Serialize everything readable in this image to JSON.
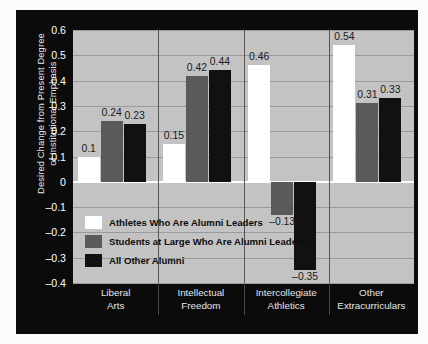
{
  "chart_data": {
    "type": "bar",
    "title": "",
    "xlabel": "",
    "ylabel": "Desired Change from Present Degree\nof Institutional Emphasis",
    "categories": [
      "Liberal\nArts",
      "Intellectual\nFreedom",
      "Intercollegiate\nAthletics",
      "Other\nExtracurriculars"
    ],
    "series": [
      {
        "name": "Athletes Who Are Alumni Leaders",
        "color": "#ffffff",
        "values": [
          0.1,
          0.15,
          0.46,
          0.54
        ],
        "labels": [
          "0.1",
          "0.15",
          "0.46",
          "0.54"
        ]
      },
      {
        "name": "Students at Large Who Are Alumni Leaders",
        "color": "#5a5a5a",
        "values": [
          0.24,
          0.42,
          -0.13,
          0.31
        ],
        "labels": [
          "0.24",
          "0.42",
          "–0.13",
          "0.31"
        ]
      },
      {
        "name": "All Other Alumni",
        "color": "#111111",
        "values": [
          0.23,
          0.44,
          -0.35,
          0.33
        ],
        "labels": [
          "0.23",
          "0.44",
          "–0.35",
          "0.33"
        ]
      }
    ],
    "ylim": [
      -0.4,
      0.6
    ],
    "ytick_values": [
      0.6,
      0.5,
      0.4,
      0.3,
      0.2,
      0.1,
      0,
      -0.1,
      -0.2,
      -0.3,
      -0.4
    ],
    "ytick_labels": [
      "0.6",
      "0.5",
      "0.4",
      "0.3",
      "0.2",
      "0.1",
      "0",
      "–0.1",
      "–0.2",
      "–0.3",
      "–0.4"
    ],
    "grid": true,
    "legend_position": "inside-lower-left",
    "plot_background": "#c3c3c3",
    "panel_background": "#0b0b0b"
  }
}
